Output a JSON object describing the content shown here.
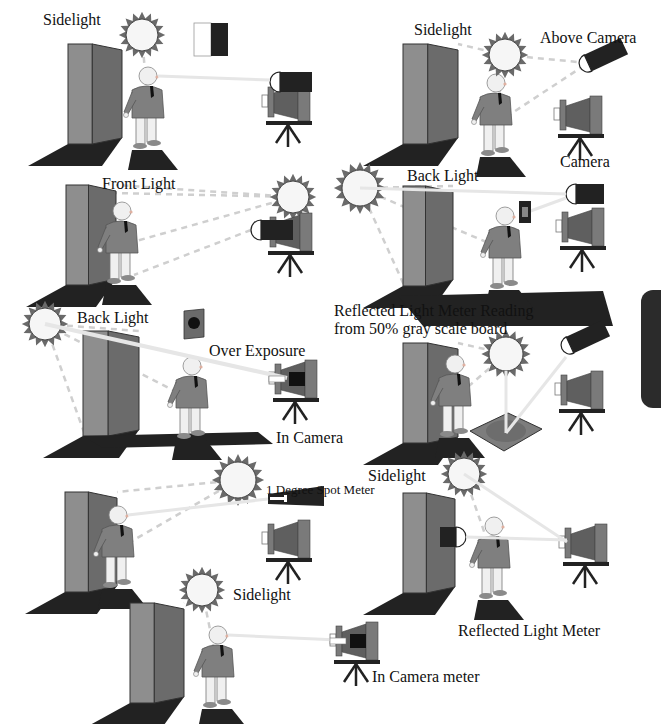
{
  "colors": {
    "wall_front": "#8e8e8e",
    "wall_side": "#6b6b6b",
    "shadow": "#222222",
    "sun_fill": "#f6f6f6",
    "sun_rays": "#6a6a6a",
    "jacket": "#7f7f7f",
    "skin": "#f0f0f0",
    "camera_body": "#7a7a7a",
    "camera_bellows": "#5f5f5f",
    "meter": "#222222",
    "beam": "#e6e6e6",
    "dash": "#cfcfcf",
    "board": "#7d7d7d",
    "edge_tab": "#2b2b2b"
  },
  "labels": [
    {
      "id": "sidelight-1",
      "text": "Sidelight",
      "x": 43,
      "y": 12
    },
    {
      "id": "sidelight-2",
      "text": "Sidelight",
      "x": 414,
      "y": 22
    },
    {
      "id": "above-camera",
      "text": "Above Camera",
      "x": 540,
      "y": 30
    },
    {
      "id": "camera",
      "text": "Camera",
      "x": 560,
      "y": 154
    },
    {
      "id": "front-light",
      "text": "Front Light",
      "x": 102,
      "y": 176
    },
    {
      "id": "back-light-1",
      "text": "Back Light",
      "x": 407,
      "y": 168
    },
    {
      "id": "reflected-reading-1",
      "text": "Reflected Light Meter Reading",
      "x": 334,
      "y": 303
    },
    {
      "id": "reflected-reading-2",
      "text": "from 50% gray scale board",
      "x": 334,
      "y": 321
    },
    {
      "id": "back-light-2",
      "text": "Back Light",
      "x": 77,
      "y": 310
    },
    {
      "id": "over-exposure",
      "text": "Over Exposure",
      "x": 209,
      "y": 343
    },
    {
      "id": "in-camera",
      "text": "In Camera",
      "x": 276,
      "y": 430
    },
    {
      "id": "one-degree-spot",
      "text": "1 Degree Spot Meter",
      "x": 266,
      "y": 483,
      "small": true
    },
    {
      "id": "sidelight-3",
      "text": "Sidelight",
      "x": 368,
      "y": 468
    },
    {
      "id": "sidelight-4",
      "text": "Sidelight",
      "x": 233,
      "y": 587
    },
    {
      "id": "reflected-light-meter",
      "text": "Reflected Light Meter",
      "x": 458,
      "y": 623
    },
    {
      "id": "in-camera-meter",
      "text": "In Camera meter",
      "x": 372,
      "y": 669
    }
  ],
  "scenes": [
    {
      "id": "sidelight-incident",
      "wall": {
        "x": 68,
        "y": 44,
        "w": 54,
        "h": 100
      },
      "person": {
        "x": 148,
        "y": 70
      },
      "sun": {
        "x": 142,
        "y": 35,
        "r": 16
      },
      "camera": {
        "x": 270,
        "y": 85
      },
      "meter": {
        "type": "incident",
        "x": 270,
        "y": 72,
        "w": 42
      }
    },
    {
      "id": "sidelight-above-camera",
      "wall": {
        "x": 403,
        "y": 44,
        "w": 55,
        "h": 100
      },
      "person": {
        "x": 496,
        "y": 77
      },
      "sun": {
        "x": 505,
        "y": 55,
        "r": 16
      },
      "camera": {
        "x": 562,
        "y": 98
      },
      "meter": {
        "type": "tilted",
        "x": 588,
        "y": 63
      }
    },
    {
      "id": "front-light",
      "wall": {
        "x": 66,
        "y": 185,
        "w": 50,
        "h": 100
      },
      "person": {
        "x": 122,
        "y": 205
      },
      "sun": {
        "x": 293,
        "y": 197,
        "r": 16
      },
      "camera": {
        "x": 272,
        "y": 215
      },
      "meter": {
        "type": "incident",
        "x": 251,
        "y": 220,
        "w": 42
      }
    },
    {
      "id": "back-light-board",
      "wall": {
        "x": 403,
        "y": 186,
        "w": 50,
        "h": 100
      },
      "person": {
        "x": 505,
        "y": 210
      },
      "sun": {
        "x": 360,
        "y": 188,
        "r": 18
      },
      "camera": {
        "x": 564,
        "y": 210
      },
      "meter": {
        "type": "incident",
        "x": 566,
        "y": 184,
        "w": 38
      },
      "board": {
        "x": 519,
        "y": 201
      }
    },
    {
      "id": "back-light-over-exposure",
      "wall": {
        "x": 83,
        "y": 331,
        "w": 56,
        "h": 105
      },
      "person": {
        "x": 192,
        "y": 360
      },
      "sun": {
        "x": 45,
        "y": 324,
        "r": 16
      },
      "camera": {
        "x": 277,
        "y": 362
      },
      "meter": {
        "type": "none"
      },
      "board_dark": {
        "x": 184,
        "y": 311
      }
    },
    {
      "id": "reflected-gray-board",
      "wall": {
        "x": 403,
        "y": 343,
        "w": 55,
        "h": 100
      },
      "person": {
        "x": 455,
        "y": 358
      },
      "sun": {
        "x": 506,
        "y": 354,
        "r": 17
      },
      "camera": {
        "x": 563,
        "y": 373
      },
      "meter": {
        "type": "tilted",
        "x": 570,
        "y": 345
      },
      "gray_board": {
        "x": 470,
        "y": 413
      }
    },
    {
      "id": "spot-meter",
      "wall": {
        "x": 65,
        "y": 492,
        "w": 52,
        "h": 100
      },
      "person": {
        "x": 118,
        "y": 509
      },
      "sun": {
        "x": 238,
        "y": 480,
        "r": 18
      },
      "camera": {
        "x": 270,
        "y": 522
      },
      "meter": {
        "type": "spot",
        "x": 268,
        "y": 490
      }
    },
    {
      "id": "reflected-wall-meter",
      "wall": {
        "x": 403,
        "y": 493,
        "w": 52,
        "h": 100
      },
      "person": {
        "x": 494,
        "y": 520
      },
      "sun": {
        "x": 464,
        "y": 474,
        "r": 16
      },
      "camera": {
        "x": 567,
        "y": 526
      },
      "meter": {
        "type": "wall",
        "x": 440,
        "y": 527
      }
    },
    {
      "id": "in-camera-meter",
      "wall": {
        "x": 130,
        "y": 603,
        "w": 54,
        "h": 100
      },
      "person": {
        "x": 218,
        "y": 629
      },
      "sun": {
        "x": 202,
        "y": 590,
        "r": 16
      },
      "camera": {
        "x": 338,
        "y": 624
      },
      "meter": {
        "type": "none"
      }
    }
  ],
  "swatch": {
    "x": 194,
    "y": 23,
    "w": 34,
    "h": 33
  }
}
